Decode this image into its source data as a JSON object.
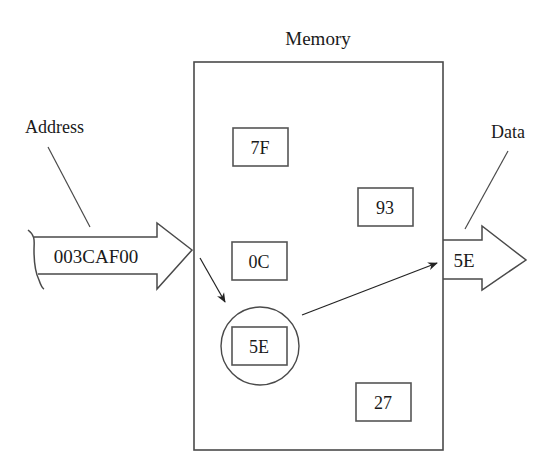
{
  "diagram": {
    "title": "Memory",
    "address": {
      "label": "Address",
      "value": "003CAF00"
    },
    "data": {
      "label": "Data",
      "value": "5E"
    },
    "cells": [
      {
        "value": "7F",
        "selected": false
      },
      {
        "value": "93",
        "selected": false
      },
      {
        "value": "0C",
        "selected": false
      },
      {
        "value": "5E",
        "selected": true
      },
      {
        "value": "27",
        "selected": false
      }
    ],
    "colors": {
      "line": "#4a4a4a",
      "text": "#1a1a1a",
      "background": "#ffffff"
    }
  }
}
